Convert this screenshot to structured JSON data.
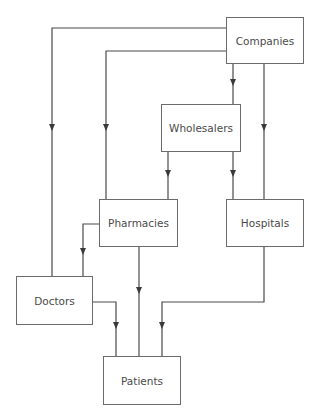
{
  "diagram": {
    "type": "flowchart",
    "nodes": {
      "companies": {
        "label": "Companies"
      },
      "wholesalers": {
        "label": "Wholesalers"
      },
      "pharmacies": {
        "label": "Pharmacies"
      },
      "hospitals": {
        "label": "Hospitals"
      },
      "doctors": {
        "label": "Doctors"
      },
      "patients": {
        "label": "Patients"
      }
    },
    "edges": [
      {
        "from": "Companies",
        "to": "Doctors"
      },
      {
        "from": "Companies",
        "to": "Pharmacies"
      },
      {
        "from": "Companies",
        "to": "Wholesalers"
      },
      {
        "from": "Companies",
        "to": "Hospitals"
      },
      {
        "from": "Wholesalers",
        "to": "Pharmacies"
      },
      {
        "from": "Wholesalers",
        "to": "Hospitals"
      },
      {
        "from": "Pharmacies",
        "to": "Doctors"
      },
      {
        "from": "Pharmacies",
        "to": "Patients"
      },
      {
        "from": "Hospitals",
        "to": "Patients"
      },
      {
        "from": "Doctors",
        "to": "Patients"
      }
    ],
    "colors": {
      "line": "#4a4a4a",
      "border": "#6b6b6b",
      "text": "#4a4a4a",
      "background": "#ffffff"
    }
  }
}
